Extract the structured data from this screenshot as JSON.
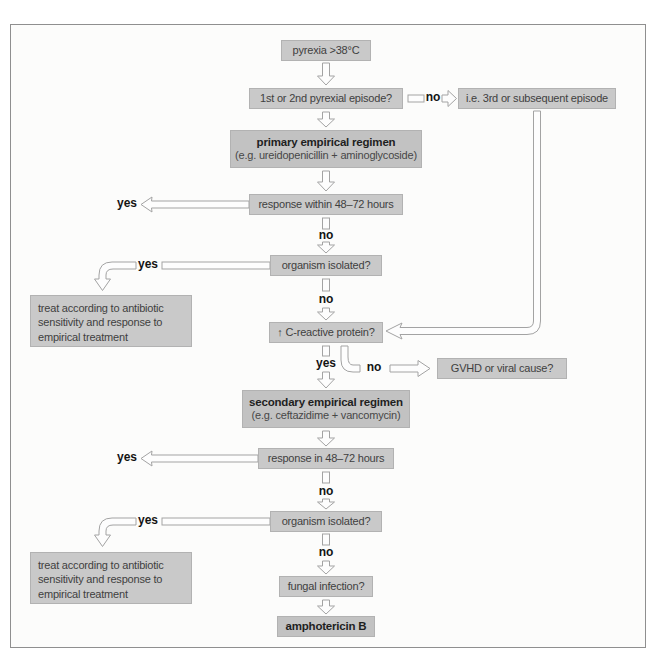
{
  "flowchart": {
    "labels": {
      "yes": "yes",
      "no": "no"
    },
    "nodes": {
      "pyrexia": {
        "text": "pyrexia >38°C"
      },
      "episode_question": {
        "text": "1st or 2nd pyrexial episode?"
      },
      "episode_alternative": {
        "text": "i.e. 3rd or subsequent episode"
      },
      "primary_regimen": {
        "title": "primary empirical regimen",
        "subtitle": "(e.g. ureidopenicillin + aminoglycoside)"
      },
      "response_1": {
        "text": "response within 48–72 hours"
      },
      "organism_1": {
        "text": "organism isolated?"
      },
      "treat_1": {
        "lines": [
          "treat according to antibiotic",
          "sensitivity and response to",
          "empirical treatment"
        ]
      },
      "crp": {
        "text": "↑ C-reactive protein?"
      },
      "gvhd": {
        "text": "GVHD or viral cause?"
      },
      "secondary_regimen": {
        "title": "secondary empirical regimen",
        "subtitle": "(e.g. ceftazidime + vancomycin)"
      },
      "response_2": {
        "text": "response in 48–72 hours"
      },
      "organism_2": {
        "text": "organism isolated?"
      },
      "treat_2": {
        "lines": [
          "treat according to antibiotic",
          "sensitivity and response to",
          "empirical treatment"
        ]
      },
      "fungal": {
        "text": "fungal infection?"
      },
      "amphotericin": {
        "text": "amphotericin B"
      }
    },
    "colors": {
      "node_fill": "#c9c9c9",
      "emphasis_node_fill": "#c2c2c2",
      "node_border": "#b2b2b2",
      "node_text": "#3f3f3f",
      "arrow_outline": "#a3a3a3",
      "arrow_fill": "#fdfdfd",
      "frame_border": "#8f8f8f",
      "background": "#fcfcfb"
    }
  }
}
